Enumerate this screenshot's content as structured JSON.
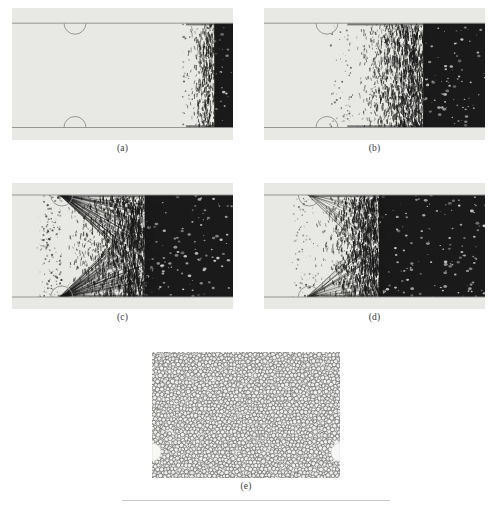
{
  "figure": {
    "kind": "multi-panel-simulation-snapshot-figure",
    "background_color": "#ffffff",
    "panel_background_color": "#e8e8e4",
    "trace_color": "#1a1a1a",
    "wall_line_color": "#8d8d8d",
    "particle_fill_color": "#f0f0ee",
    "particle_outline_color": "#4a4a4a",
    "panel_count": 5,
    "labels": [
      "(a)",
      "(b)",
      "(c)",
      "(d)",
      "(e)"
    ]
  },
  "panels": [
    {
      "id": "panel-a",
      "label": "(a)",
      "type": "channel-trace",
      "x": 12,
      "y": 8,
      "width": 221,
      "height": 132,
      "label_y": 143,
      "wall_top_frac": 0.115,
      "wall_bottom_frac": 0.905,
      "obstacle_x_frac": 0.285,
      "obstacle_radius": 11,
      "front_frac": 0.805,
      "solid_frac": 0.915,
      "roughness": 0.085,
      "density": 0.72,
      "streaks": 0,
      "seed": 1301
    },
    {
      "id": "panel-b",
      "label": "(b)",
      "type": "channel-trace",
      "x": 264,
      "y": 8,
      "width": 221,
      "height": 132,
      "label_y": 143,
      "wall_top_frac": 0.115,
      "wall_bottom_frac": 0.905,
      "obstacle_x_frac": 0.285,
      "obstacle_radius": 11,
      "front_frac": 0.395,
      "solid_frac": 0.72,
      "roughness": 0.075,
      "density": 0.8,
      "streaks": 0,
      "seed": 2207
    },
    {
      "id": "panel-c",
      "label": "(c)",
      "type": "channel-trace",
      "x": 12,
      "y": 183,
      "width": 221,
      "height": 126,
      "label_y": 312,
      "wall_top_frac": 0.095,
      "wall_bottom_frac": 0.905,
      "obstacle_x_frac": 0.225,
      "obstacle_radius": 11,
      "front_frac": 0.225,
      "solid_frac": 0.6,
      "roughness": 0.1,
      "density": 0.86,
      "streaks": 150,
      "seed": 3371
    },
    {
      "id": "panel-d",
      "label": "(d)",
      "type": "channel-trace",
      "x": 264,
      "y": 183,
      "width": 221,
      "height": 126,
      "label_y": 312,
      "wall_top_frac": 0.095,
      "wall_bottom_frac": 0.905,
      "obstacle_x_frac": 0.205,
      "obstacle_radius": 11,
      "front_frac": 0.225,
      "solid_frac": 0.52,
      "roughness": 0.065,
      "density": 0.9,
      "streaks": 40,
      "seed": 4493
    },
    {
      "id": "panel-e",
      "label": "(e)",
      "type": "granular-packing",
      "x": 152,
      "y": 352,
      "width": 188,
      "height": 126,
      "label_y": 481,
      "particle_radius": 2.05,
      "particle_count": 2400,
      "void_radius": 9,
      "void_y_frac": 0.795,
      "seed": 5581
    }
  ]
}
